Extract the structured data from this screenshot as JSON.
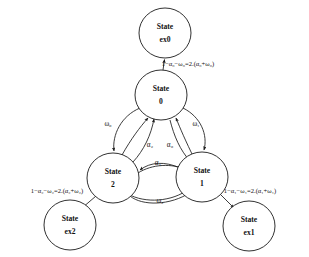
{
  "diagram": {
    "type": "state-transition-diagram",
    "background_color": "#ffffff",
    "stroke_color": "#1a1a1a",
    "text_color": "#111111"
  },
  "nodes": [
    {
      "id": "ex0",
      "role": "exit-state",
      "line1": "State",
      "line2": "ex0",
      "cx": 165,
      "cy": 33,
      "rx": 26,
      "ry": 25
    },
    {
      "id": "s0",
      "role": "main-state",
      "line1": "State",
      "line2": "0",
      "cx": 161,
      "cy": 95,
      "rx": 26,
      "ry": 25
    },
    {
      "id": "s2",
      "role": "main-state",
      "line1": "State",
      "line2": "2",
      "cx": 113,
      "cy": 178,
      "rx": 26,
      "ry": 25
    },
    {
      "id": "s1",
      "role": "main-state",
      "line1": "State",
      "line2": "1",
      "cx": 202,
      "cy": 177,
      "rx": 26,
      "ry": 25
    },
    {
      "id": "ex2",
      "role": "exit-state",
      "line1": "State",
      "line2": "ex2",
      "cx": 70,
      "cy": 225,
      "rx": 26,
      "ry": 25
    },
    {
      "id": "ex1",
      "role": "exit-state",
      "line1": "State",
      "line2": "ex1",
      "cx": 249,
      "cy": 226,
      "rx": 26,
      "ry": 25
    }
  ],
  "edges": [
    {
      "id": "s0-to-ex0",
      "from": "s0",
      "to": "ex0",
      "label": "1−α₀−ω₀=2.(α₀+ω₀)",
      "label_style": "long",
      "label_x": 188,
      "label_y": 64
    },
    {
      "id": "s0-to-s2",
      "from": "s0",
      "to": "s2",
      "label": "ω₀",
      "label_style": "short",
      "label_x": 108,
      "label_y": 124
    },
    {
      "id": "s0-to-s1",
      "from": "s0",
      "to": "s1",
      "label": "ω₁",
      "label_style": "short",
      "label_x": 196,
      "label_y": 124
    },
    {
      "id": "s2-to-s0",
      "from": "s2",
      "to": "s0",
      "label": "α₂",
      "label_style": "short",
      "label_x": 150,
      "label_y": 145
    },
    {
      "id": "s0-to-s1-inner",
      "from": "s0",
      "to": "s1",
      "label": "α₀",
      "label_style": "short",
      "label_x": 170,
      "label_y": 145
    },
    {
      "id": "s2-to-s1-top",
      "from": "s2",
      "to": "s1",
      "label": "α₁",
      "label_style": "short",
      "label_x": 158,
      "label_y": 163
    },
    {
      "id": "s1-to-s2-bottom",
      "from": "s1",
      "to": "s2",
      "label": "ω₂",
      "label_style": "short",
      "label_x": 160,
      "label_y": 201
    },
    {
      "id": "s2-to-ex2",
      "from": "s2",
      "to": "ex2",
      "label": "1−α₂−ω₂=2.(α₂+ω₂)",
      "label_style": "long",
      "label_x": 57,
      "label_y": 191
    },
    {
      "id": "s1-to-ex1",
      "from": "s1",
      "to": "ex1",
      "label": "1−α₁−ω₁=2.(α₁+ω₁)",
      "label_style": "long",
      "label_x": 250,
      "label_y": 191
    }
  ],
  "symbols": {
    "alpha": "α",
    "omega": "ω",
    "minus": "−"
  }
}
